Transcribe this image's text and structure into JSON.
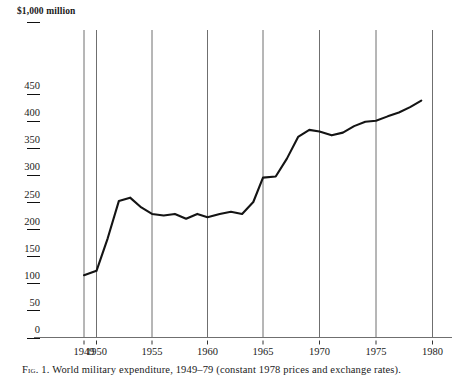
{
  "figure": {
    "axis_title": "$1,000 million",
    "caption_label": "Fig. 1.",
    "caption_text": "World military expenditure, 1949–79 (constant 1978 prices and exchange rates)."
  },
  "axes": {
    "y_ticks": [
      "0",
      "50",
      "100",
      "150",
      "200",
      "250",
      "300",
      "350",
      "400",
      "450"
    ],
    "x_ticks": [
      "1949",
      "1950",
      "1955",
      "1960",
      "1965",
      "1970",
      "1975",
      "1980"
    ]
  },
  "colors": {
    "line": "#141414",
    "gridline": "#6f6f6f",
    "axis": "#6f6f6f",
    "text": "#1a1a1a",
    "background": "#ffffff"
  },
  "chart_data": {
    "type": "line",
    "title": "World military expenditure, 1949–79 (constant 1978 prices and exchange rates)",
    "xlabel": "",
    "ylabel": "$1,000 million",
    "xlim": [
      1948,
      1980
    ],
    "ylim": [
      0,
      470
    ],
    "grid": "vertical gridlines at 1949, 1950, 1955, 1960, 1965, 1970, 1975, 1980",
    "legend": "none",
    "y_tick_values": [
      0,
      50,
      100,
      150,
      200,
      250,
      300,
      350,
      400,
      450
    ],
    "x_tick_values": [
      1949,
      1950,
      1955,
      1960,
      1965,
      1970,
      1975,
      1980
    ],
    "x": [
      1949,
      1950,
      1951,
      1952,
      1953,
      1954,
      1955,
      1956,
      1957,
      1958,
      1959,
      1960,
      1961,
      1962,
      1963,
      1964,
      1965,
      1966,
      1967,
      1968,
      1969,
      1970,
      1971,
      1972,
      1973,
      1974,
      1975,
      1976,
      1977,
      1978,
      1979
    ],
    "values": [
      115,
      123,
      183,
      252,
      258,
      240,
      228,
      225,
      228,
      219,
      228,
      222,
      228,
      232,
      228,
      250,
      295,
      297,
      330,
      370,
      383,
      380,
      373,
      378,
      390,
      398,
      400,
      408,
      415,
      425,
      437
    ],
    "series": [
      {
        "name": "World military expenditure",
        "values": [
          115,
          123,
          183,
          252,
          258,
          240,
          228,
          225,
          228,
          219,
          228,
          222,
          228,
          232,
          228,
          250,
          295,
          297,
          330,
          370,
          383,
          380,
          373,
          378,
          390,
          398,
          400,
          408,
          415,
          425,
          437
        ]
      }
    ]
  }
}
